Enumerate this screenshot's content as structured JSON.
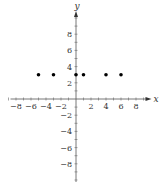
{
  "chart_data": {
    "type": "scatter",
    "title": "",
    "xlabel": "x",
    "ylabel": "y",
    "xlim": [
      -9,
      9
    ],
    "ylim": [
      -10,
      10
    ],
    "grid": false,
    "x_ticks": [
      -8,
      -6,
      -4,
      -2,
      2,
      4,
      6,
      8
    ],
    "y_ticks": [
      -8,
      -6,
      -4,
      -2,
      2,
      4,
      6,
      8
    ],
    "minor_tick_step": 1,
    "series": [
      {
        "name": "points",
        "points": [
          {
            "x": -5,
            "y": 3
          },
          {
            "x": -3,
            "y": 3
          },
          {
            "x": 0,
            "y": 3
          },
          {
            "x": 1,
            "y": 3
          },
          {
            "x": 4,
            "y": 3
          },
          {
            "x": 6,
            "y": 3
          }
        ],
        "color": "#000000"
      }
    ]
  },
  "axes": {
    "x_label": "x",
    "y_label": "y",
    "x_tick_labels": [
      "−8",
      "−6",
      "−4",
      "−2",
      "2",
      "4",
      "6",
      "8"
    ],
    "y_tick_labels": [
      "8",
      "6",
      "4",
      "2",
      "−2",
      "−4",
      "−6",
      "−8"
    ]
  }
}
